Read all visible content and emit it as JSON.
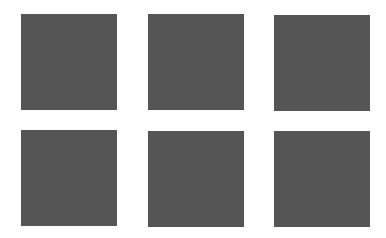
{
  "grid_size": 5,
  "stroke_color": "#555555",
  "mazes": [
    {
      "name": "maze-1",
      "walls": [
        [
          0,
          1,
          2,
          1
        ],
        [
          0,
          2,
          1,
          2
        ],
        [
          1,
          3,
          1,
          4
        ],
        [
          2,
          2,
          2,
          4
        ],
        [
          3,
          1,
          3,
          4
        ],
        [
          4,
          1,
          4,
          4
        ],
        [
          0,
          4,
          4,
          4
        ]
      ]
    },
    {
      "name": "maze-2",
      "walls": [
        [
          0,
          1,
          1,
          1
        ],
        [
          2,
          1,
          3,
          1
        ],
        [
          2,
          1,
          2,
          2
        ],
        [
          1,
          2,
          2,
          2
        ],
        [
          1,
          2,
          1,
          3
        ],
        [
          0,
          3,
          1,
          3
        ],
        [
          4,
          1,
          4,
          2
        ],
        [
          3,
          2,
          4,
          2
        ],
        [
          3,
          2,
          3,
          3
        ],
        [
          2,
          3,
          3,
          3
        ],
        [
          2,
          3,
          2,
          4
        ],
        [
          0,
          4,
          2,
          4
        ],
        [
          4,
          3,
          4,
          4
        ],
        [
          3,
          4,
          4,
          4
        ],
        [
          3,
          4,
          3,
          5
        ]
      ]
    },
    {
      "name": "maze-3",
      "walls": [
        [
          0,
          1,
          1,
          1
        ],
        [
          2,
          1,
          3,
          1
        ],
        [
          2,
          1,
          2,
          3
        ],
        [
          2,
          2,
          4,
          2
        ],
        [
          4,
          1,
          4,
          2
        ],
        [
          1,
          2,
          1,
          4
        ],
        [
          1,
          3,
          3,
          3
        ],
        [
          0,
          4,
          2,
          4
        ],
        [
          3,
          4,
          3,
          5
        ],
        [
          4,
          3,
          4,
          5
        ]
      ]
    },
    {
      "name": "maze-4",
      "walls": [
        [
          1,
          1,
          1,
          2
        ],
        [
          0,
          2,
          1,
          2
        ],
        [
          2,
          1,
          2,
          5
        ],
        [
          3,
          1,
          4,
          1
        ],
        [
          3,
          1,
          3,
          3
        ],
        [
          3,
          2,
          4,
          2
        ],
        [
          2,
          3,
          3,
          3
        ],
        [
          1,
          3,
          1,
          5
        ],
        [
          4,
          3,
          4,
          4
        ],
        [
          3,
          4,
          4,
          4
        ],
        [
          3,
          4,
          3,
          5
        ]
      ]
    },
    {
      "name": "maze-5",
      "walls": [
        [
          1,
          1,
          2,
          1
        ],
        [
          1,
          1,
          1,
          3
        ],
        [
          1,
          2,
          3,
          2
        ],
        [
          3,
          1,
          4,
          1
        ],
        [
          3,
          1,
          3,
          2
        ],
        [
          4,
          2,
          4,
          3
        ],
        [
          0,
          3,
          4,
          3
        ],
        [
          1,
          4,
          2,
          4
        ],
        [
          1,
          4,
          1,
          5
        ],
        [
          3,
          4,
          4,
          4
        ],
        [
          3,
          4,
          3,
          5
        ]
      ]
    },
    {
      "name": "maze-6",
      "walls": [
        [
          1,
          1,
          3,
          1
        ],
        [
          1,
          1,
          1,
          2
        ],
        [
          0,
          2,
          1,
          2
        ],
        [
          4,
          1,
          4,
          4
        ],
        [
          2,
          2,
          3,
          2
        ],
        [
          2,
          2,
          2,
          4
        ],
        [
          0,
          3,
          1,
          3
        ],
        [
          0,
          4,
          2,
          4
        ],
        [
          3,
          3,
          3,
          5
        ],
        [
          3,
          4,
          4,
          4
        ]
      ]
    }
  ]
}
